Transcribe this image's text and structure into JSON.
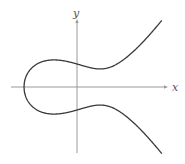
{
  "diagram": {
    "equation": "y^2 = x^3 - x + 1",
    "axes": {
      "x_label": "x",
      "y_label": "y",
      "color": "#9a9a9a"
    },
    "curve": {
      "color": "#3a3a3a",
      "a": -1,
      "b": 1,
      "x_min": -1.3247,
      "x_max": 2.12
    },
    "layout": {
      "origin_px": [
        77,
        87
      ],
      "scale_x": 40,
      "scale_y": 23,
      "x_axis_px": [
        11,
        167
      ],
      "y_axis_px": [
        20,
        153
      ]
    }
  }
}
